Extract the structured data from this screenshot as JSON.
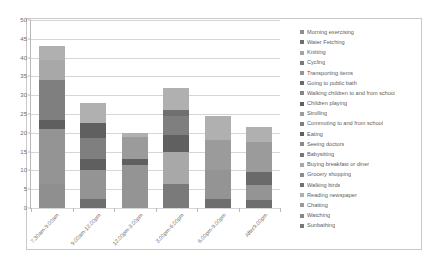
{
  "chart_data": {
    "type": "bar",
    "subtype": "stacked-vertical",
    "title": "",
    "xlabel": "",
    "ylabel": "",
    "ylim": [
      0,
      50
    ],
    "ytick_step": 5,
    "yticks": [
      "50",
      "45",
      "40",
      "35",
      "30",
      "25",
      "20",
      "15",
      "10",
      "5",
      "0"
    ],
    "grid": true,
    "legend_position": "right",
    "categories": [
      "7.30am-9.00am",
      "9.00am-12.00pm",
      "12.00pm-3.00pm",
      "3.00pm-6.00pm",
      "6.00pm-9.00pm",
      "After9.00pm"
    ],
    "totals": [
      43,
      28,
      20,
      32,
      24.5,
      21.5
    ],
    "series": [
      {
        "name": "Morning exercising",
        "color": "#8f8f8f",
        "values": [
          6.5,
          0,
          0,
          0,
          0,
          0
        ]
      },
      {
        "name": "Water Fetching",
        "color": "#6e6e6e",
        "values": [
          0,
          2.5,
          0,
          0,
          2.5,
          2
        ]
      },
      {
        "name": "Knitting",
        "color": "#a3a3a3",
        "values": [
          0,
          0,
          0,
          0,
          0,
          0
        ]
      },
      {
        "name": "Cycling",
        "color": "#7a7a7a",
        "values": [
          0,
          0,
          0,
          6.5,
          0,
          0
        ]
      },
      {
        "name": "Transporting items",
        "color": "#949494",
        "values": [
          14.5,
          7.5,
          11.5,
          0,
          7.5,
          4
        ]
      },
      {
        "name": "Going to public bath",
        "color": "#6a6a6a",
        "values": [
          0,
          0,
          0,
          0,
          0,
          3.5
        ]
      },
      {
        "name": "Walking children to and from school",
        "color": "#868686",
        "values": [
          0,
          0,
          0,
          0,
          0,
          0
        ]
      },
      {
        "name": "Children playing",
        "color": "#5f5f5f",
        "values": [
          2.5,
          3,
          1.5,
          0,
          0,
          0
        ]
      },
      {
        "name": "Strolling",
        "color": "#9b9b9b",
        "values": [
          0,
          0,
          6,
          0,
          8,
          8
        ]
      },
      {
        "name": "Commuting  to and from school",
        "color": "#7f7f7f",
        "values": [
          10.5,
          5.5,
          0,
          5,
          0,
          0
        ]
      },
      {
        "name": "Eating",
        "color": "#606060",
        "values": [
          0,
          4,
          0,
          4.5,
          0,
          0
        ]
      },
      {
        "name": "Seeing doctors",
        "color": "#8a8a8a",
        "values": [
          0,
          0,
          0,
          0,
          0,
          0
        ]
      },
      {
        "name": "Babysitting",
        "color": "#767676",
        "values": [
          0,
          0,
          0,
          0,
          0,
          0
        ]
      },
      {
        "name": "Buying breakfast or diner",
        "color": "#a8a8a8",
        "values": [
          5.5,
          0,
          0,
          8.5,
          0,
          0
        ]
      },
      {
        "name": "Grocery shopping",
        "color": "#8c8c8c",
        "values": [
          0,
          0,
          0,
          0,
          0,
          0
        ]
      },
      {
        "name": "Walking birds",
        "color": "#707070",
        "values": [
          0,
          0,
          0,
          1.5,
          0,
          0
        ]
      },
      {
        "name": "Reading newspaper",
        "color": "#b0b0b0",
        "values": [
          3.5,
          5.5,
          1,
          6,
          6.5,
          4
        ]
      },
      {
        "name": "Chatting",
        "color": "#9a9a9a",
        "values": [
          0,
          0,
          0,
          0,
          0,
          0
        ]
      },
      {
        "name": "Watching",
        "color": "#888888",
        "values": [
          0,
          0,
          0,
          0,
          0,
          0
        ]
      },
      {
        "name": "Sunbathing",
        "color": "#787878",
        "values": [
          0,
          0,
          0,
          0,
          0,
          0
        ]
      }
    ],
    "stacks": [
      {
        "category": "7.30am-9.00am",
        "segments": [
          {
            "label": "Morning exercising",
            "value": 6.5,
            "color": "#8f8f8f"
          },
          {
            "label": "Transporting items",
            "value": 14.5,
            "color": "#949494"
          },
          {
            "label": "Children playing",
            "value": 2.5,
            "color": "#5f5f5f"
          },
          {
            "label": "Commuting  to and from school",
            "value": 10.5,
            "color": "#7f7f7f"
          },
          {
            "label": "Buying breakfast or diner",
            "value": 5.5,
            "color": "#a8a8a8"
          },
          {
            "label": "Reading newspaper",
            "value": 3.5,
            "color": "#b0b0b0"
          }
        ]
      },
      {
        "category": "9.00am-12.00pm",
        "segments": [
          {
            "label": "Water Fetching",
            "value": 2.5,
            "color": "#6e6e6e"
          },
          {
            "label": "Transporting items",
            "value": 7.5,
            "color": "#949494"
          },
          {
            "label": "Children playing",
            "value": 3.0,
            "color": "#5f5f5f"
          },
          {
            "label": "Commuting  to and from school",
            "value": 5.5,
            "color": "#7f7f7f"
          },
          {
            "label": "Eating",
            "value": 4.0,
            "color": "#606060"
          },
          {
            "label": "Reading newspaper",
            "value": 5.5,
            "color": "#b0b0b0"
          }
        ]
      },
      {
        "category": "12.00pm-3.00pm",
        "segments": [
          {
            "label": "Transporting items",
            "value": 11.5,
            "color": "#949494"
          },
          {
            "label": "Children playing",
            "value": 1.5,
            "color": "#5f5f5f"
          },
          {
            "label": "Strolling",
            "value": 6.0,
            "color": "#9b9b9b"
          },
          {
            "label": "Reading newspaper",
            "value": 1.0,
            "color": "#b0b0b0"
          }
        ]
      },
      {
        "category": "3.00pm-6.00pm",
        "segments": [
          {
            "label": "Cycling",
            "value": 6.5,
            "color": "#7a7a7a"
          },
          {
            "label": "Buying breakfast or diner",
            "value": 8.5,
            "color": "#a8a8a8"
          },
          {
            "label": "Eating",
            "value": 4.5,
            "color": "#606060"
          },
          {
            "label": "Commuting  to and from school",
            "value": 5.0,
            "color": "#7f7f7f"
          },
          {
            "label": "Walking birds",
            "value": 1.5,
            "color": "#707070"
          },
          {
            "label": "Reading newspaper",
            "value": 6.0,
            "color": "#b0b0b0"
          }
        ]
      },
      {
        "category": "6.00pm-9.00pm",
        "segments": [
          {
            "label": "Water Fetching",
            "value": 2.5,
            "color": "#6e6e6e"
          },
          {
            "label": "Transporting items",
            "value": 7.5,
            "color": "#949494"
          },
          {
            "label": "Strolling",
            "value": 8.0,
            "color": "#9b9b9b"
          },
          {
            "label": "Reading newspaper",
            "value": 6.5,
            "color": "#b0b0b0"
          }
        ]
      },
      {
        "category": "After9.00pm",
        "segments": [
          {
            "label": "Water Fetching",
            "value": 2.0,
            "color": "#6e6e6e"
          },
          {
            "label": "Transporting items",
            "value": 4.0,
            "color": "#949494"
          },
          {
            "label": "Going to public bath",
            "value": 3.5,
            "color": "#6a6a6a"
          },
          {
            "label": "Strolling",
            "value": 8.0,
            "color": "#9b9b9b"
          },
          {
            "label": "Reading newspaper",
            "value": 4.0,
            "color": "#b0b0b0"
          }
        ]
      }
    ]
  }
}
